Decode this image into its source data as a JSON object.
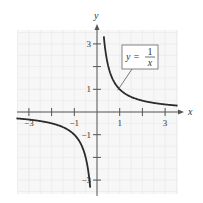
{
  "chart_data": {
    "type": "line",
    "title": "",
    "xlabel": "x",
    "ylabel": "y",
    "xlim": [
      -3.5,
      3.5
    ],
    "ylim": [
      -3.5,
      3.5
    ],
    "grid": true,
    "x_ticks": [
      -3,
      -2,
      -1,
      1,
      2,
      3
    ],
    "x_tick_labels": [
      "-3",
      "",
      "-1",
      "1",
      "",
      "3"
    ],
    "y_ticks": [
      3,
      2,
      1,
      -1,
      -2,
      -3
    ],
    "y_tick_labels": [
      "3",
      "",
      "1",
      "-1",
      "",
      "-3"
    ],
    "series": [
      {
        "name": "y = 1/x",
        "function": "1/x",
        "branches": [
          {
            "x_range": [
              0.3,
              3.55
            ]
          },
          {
            "x_range": [
              -3.55,
              -0.3
            ]
          }
        ]
      }
    ],
    "annotation": {
      "text_lhs": "y =",
      "numerator": "1",
      "denominator": "x",
      "pointer_to": [
        1,
        1
      ]
    },
    "colors": {
      "curve": "#2b2b2b",
      "axis": "#555555",
      "grid": "#ebebeb",
      "grid_bg": "#f7f7f7"
    }
  }
}
